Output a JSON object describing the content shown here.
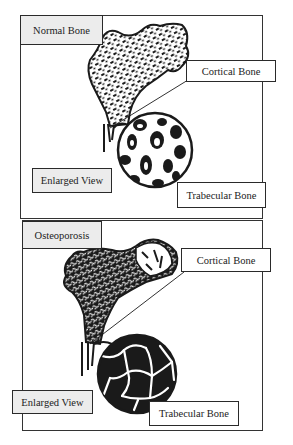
{
  "diagram": {
    "panels": [
      {
        "id": "normal",
        "title": "Normal Bone",
        "labels": {
          "cortical": "Cortical Bone",
          "enlarged": "Enlarged View",
          "trabecular": "Trabecular Bone"
        }
      },
      {
        "id": "osteoporosis",
        "title": "Osteoporosis",
        "labels": {
          "cortical": "Cortical Bone",
          "enlarged": "Enlarged View",
          "trabecular": "Trabecular Bone"
        }
      }
    ],
    "colors": {
      "ink": "#1a1a1a",
      "label_fill": "#ececec",
      "background": "#ffffff"
    }
  }
}
